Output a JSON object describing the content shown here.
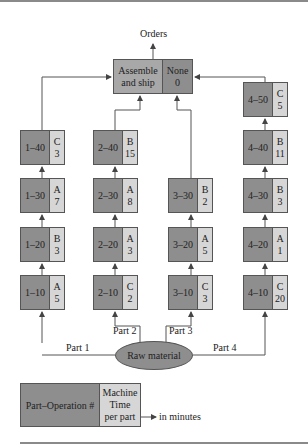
{
  "diagram": {
    "top_label": "Orders",
    "assemble": {
      "name_line1": "Assemble",
      "name_line2": "and ship",
      "machine": "None",
      "time": "0"
    },
    "raw_material": "Raw material",
    "part_labels": [
      "Part 1",
      "Part 2",
      "Part 3",
      "Part 4"
    ],
    "columns": [
      {
        "part": "Part 1",
        "ops": [
          {
            "op": "1–40",
            "machine": "C",
            "time": "3"
          },
          {
            "op": "1–30",
            "machine": "A",
            "time": "7"
          },
          {
            "op": "1–20",
            "machine": "B",
            "time": "3"
          },
          {
            "op": "1–10",
            "machine": "A",
            "time": "5"
          }
        ]
      },
      {
        "part": "Part 2",
        "ops": [
          {
            "op": "2–40",
            "machine": "B",
            "time": "15"
          },
          {
            "op": "2–30",
            "machine": "A",
            "time": "8"
          },
          {
            "op": "2–20",
            "machine": "A",
            "time": "3"
          },
          {
            "op": "2–10",
            "machine": "C",
            "time": "2"
          }
        ]
      },
      {
        "part": "Part 3",
        "ops": [
          {
            "op": "3–30",
            "machine": "B",
            "time": "2"
          },
          {
            "op": "3–20",
            "machine": "A",
            "time": "5"
          },
          {
            "op": "3–10",
            "machine": "C",
            "time": "3"
          }
        ]
      },
      {
        "part": "Part 4",
        "ops": [
          {
            "op": "4–50",
            "machine": "C",
            "time": "5"
          },
          {
            "op": "4–40",
            "machine": "B",
            "time": "11"
          },
          {
            "op": "4–30",
            "machine": "B",
            "time": "3"
          },
          {
            "op": "4–20",
            "machine": "A",
            "time": "1"
          },
          {
            "op": "4–10",
            "machine": "C",
            "time": "20"
          }
        ]
      }
    ],
    "legend": {
      "left": "Part–Operation #",
      "right_line1": "Machine",
      "right_line2": "Time",
      "right_line3": "per part",
      "note": "in minutes"
    }
  },
  "colors": {
    "dark_fill": "#8e8e8e",
    "light_fill": "#d6d6d6",
    "assemble_fill": "#a8a8a8",
    "line": "#555555"
  }
}
